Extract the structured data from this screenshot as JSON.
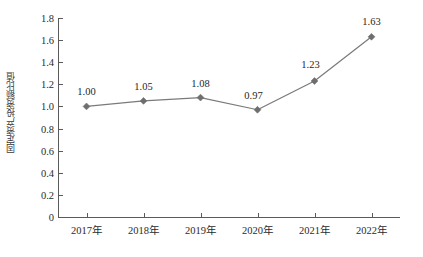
{
  "chart_data": {
    "type": "line",
    "title": "",
    "xlabel": "",
    "ylabel": "固定资产投资额比值",
    "categories": [
      "2017年",
      "2018年",
      "2019年",
      "2020年",
      "2021年",
      "2022年"
    ],
    "values": [
      1.0,
      1.05,
      1.08,
      0.97,
      1.23,
      1.63
    ],
    "point_labels": [
      "1.00",
      "1.05",
      "1.08",
      "0.97",
      "1.23",
      "1.63"
    ],
    "ylim": [
      0,
      1.8
    ],
    "y_ticks": [
      0,
      0.2,
      0.4,
      0.6,
      0.8,
      1.0,
      1.2,
      1.4,
      1.6,
      1.8
    ],
    "y_tick_labels": [
      "0",
      "0.2",
      "0.4",
      "0.6",
      "0.8",
      "1.0",
      "1.2",
      "1.4",
      "1.6",
      "1.8"
    ],
    "grid": false,
    "legend": "none",
    "series": [
      {
        "name": "固定资产投资额比值",
        "values": [
          1.0,
          1.05,
          1.08,
          0.97,
          1.23,
          1.63
        ],
        "marker": "diamond",
        "line_color": "#7a7a7a",
        "marker_color": "#6e6e6e"
      }
    ],
    "colors": {
      "line": "#7a7a7a",
      "marker": "#6e6e6e",
      "axis": "#5a5a5a",
      "text": "#2b2b2b",
      "background": "#ffffff"
    }
  }
}
